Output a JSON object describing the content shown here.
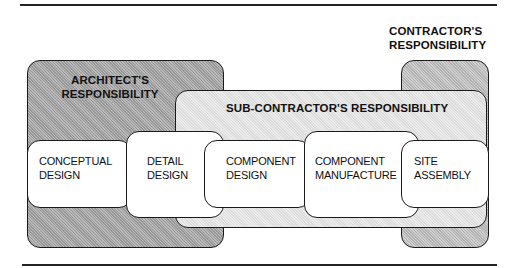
{
  "diagram": {
    "responsibilities": {
      "architect": {
        "line1": "ARCHITECT'S",
        "line2": "RESPONSIBILITY"
      },
      "sub_contractor": {
        "label": "SUB-CONTRACTOR'S RESPONSIBILITY"
      },
      "contractor": {
        "line1": "CONTRACTOR'S",
        "line2": "RESPONSIBILITY"
      }
    },
    "stages": [
      {
        "line1": "CONCEPTUAL",
        "line2": "DESIGN"
      },
      {
        "line1": "DETAIL",
        "line2": "DESIGN"
      },
      {
        "line1": "COMPONENT",
        "line2": "DESIGN"
      },
      {
        "line1": "COMPONENT",
        "line2": "MANUFACTURE"
      },
      {
        "line1": "SITE",
        "line2": "ASSEMBLY"
      }
    ],
    "colors": {
      "architect_fill": "#b9b9b9",
      "contractor_fill": "#cfcfcf",
      "subcontractor_fill": "#ececec",
      "stage_fill": "#ffffff",
      "stroke": "#1a1a1a"
    }
  }
}
